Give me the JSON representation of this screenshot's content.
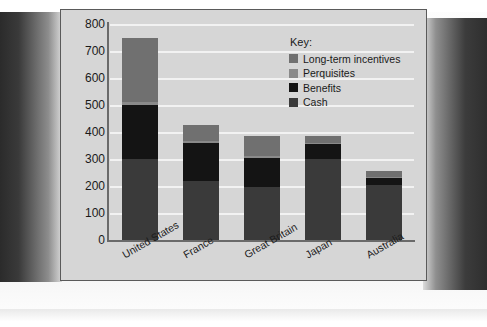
{
  "chart_data": {
    "type": "bar",
    "subtype": "stacked-bar",
    "title": "",
    "xlabel": "",
    "ylabel": "",
    "ylim": [
      0,
      800
    ],
    "ytick_step": 100,
    "yticks": [
      800,
      700,
      600,
      500,
      400,
      300,
      200,
      100,
      0
    ],
    "grid": true,
    "legend_position": "top-right",
    "categories": [
      "United States",
      "France",
      "Great Britain",
      "Japan",
      "Australia"
    ],
    "series": [
      {
        "name": "Cash",
        "color": "#3a3a3a",
        "values": [
          300,
          220,
          195,
          300,
          205
        ]
      },
      {
        "name": "Benefits",
        "color": "#141414",
        "values": [
          200,
          140,
          110,
          55,
          25
        ]
      },
      {
        "name": "Perquisites",
        "color": "#8a8a8a",
        "values": [
          10,
          5,
          5,
          5,
          5
        ]
      },
      {
        "name": "Long-term incentives",
        "color": "#707070",
        "values": [
          240,
          60,
          75,
          25,
          20
        ]
      }
    ],
    "totals": [
      750,
      425,
      385,
      385,
      255
    ]
  },
  "legend": {
    "title": "Key:",
    "items": [
      {
        "label": "Long-term incentives",
        "color": "#707070"
      },
      {
        "label": "Perquisites",
        "color": "#8a8a8a"
      },
      {
        "label": "Benefits",
        "color": "#141414"
      },
      {
        "label": "Cash",
        "color": "#3a3a3a"
      }
    ]
  },
  "colors": {
    "panel_background": "#d6d6d6",
    "panel_border": "#5a5a5a",
    "gridline": "#f2f2f2",
    "axis": "#6a6a6a",
    "text": "#1a1a1a",
    "page_background": "#ffffff"
  }
}
